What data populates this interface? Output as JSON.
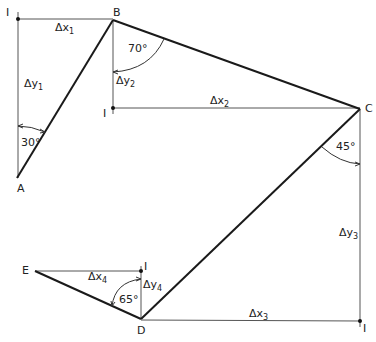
{
  "diagram": {
    "type": "traverse-survey",
    "colors": {
      "line": "#1a1a1a",
      "construction": "#555555",
      "background": "#ffffff"
    },
    "points": {
      "A": {
        "label": "A",
        "x": 17,
        "y": 178
      },
      "B": {
        "label": "B",
        "x": 113,
        "y": 20
      },
      "C": {
        "label": "C",
        "x": 360,
        "y": 109
      },
      "D": {
        "label": "D",
        "x": 141,
        "y": 319
      },
      "E": {
        "label": "E",
        "x": 35,
        "y": 271
      }
    },
    "intersections": [
      {
        "label": "I",
        "x": 18,
        "y": 19
      },
      {
        "label": "I",
        "x": 113,
        "y": 108
      },
      {
        "label": "I",
        "x": 360,
        "y": 321
      },
      {
        "label": "I",
        "x": 141,
        "y": 272
      }
    ],
    "legs": [
      {
        "from": "A",
        "to": "B"
      },
      {
        "from": "B",
        "to": "C"
      },
      {
        "from": "C",
        "to": "D"
      },
      {
        "from": "D",
        "to": "E"
      }
    ],
    "deltas": {
      "dx1": {
        "main": "Δx",
        "sub": "1"
      },
      "dy1": {
        "main": "Δy",
        "sub": "1"
      },
      "dx2": {
        "main": "Δx",
        "sub": "2"
      },
      "dy2": {
        "main": "Δy",
        "sub": "2"
      },
      "dx3": {
        "main": "Δx",
        "sub": "3"
      },
      "dy3": {
        "main": "Δy",
        "sub": "3"
      },
      "dx4": {
        "main": "Δx",
        "sub": "4"
      },
      "dy4": {
        "main": "Δy",
        "sub": "4"
      }
    },
    "angles": {
      "a": "30°",
      "b": "70°",
      "c": "45°",
      "d": "65°"
    }
  }
}
